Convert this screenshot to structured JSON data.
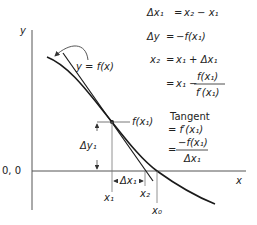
{
  "diagram": {
    "type": "newton-raphson-tangent-method",
    "axes": {
      "y_label": "y",
      "x_label": "x",
      "origin_label": "0, 0"
    },
    "curve_label": "y = f(x)",
    "point_label": "f(x₁)",
    "delta_y_label": "Δy₁",
    "delta_x_label": "Δx₁",
    "x_ticks": {
      "x1": "x₁",
      "x2": "x₂",
      "x0": "x₀"
    },
    "equations": [
      {
        "lhs": "Δx₁",
        "rhs": "x₂ − x₁"
      },
      {
        "lhs": "Δy",
        "rhs": "−f(x₁)"
      },
      {
        "lhs": "x₂",
        "rhs": "x₁ + Δx₁"
      },
      {
        "lhs": "",
        "rhs_prefix": "x₁ −",
        "frac_num": "f(x₁)",
        "frac_den": "f′(x₁)"
      }
    ],
    "tangent_block": {
      "title": "Tangent",
      "line1": "= f′(x₁)",
      "frac_prefix": "=",
      "frac_num": "−f(x₁)",
      "frac_den": "Δx₁"
    },
    "colors": {
      "curve": "#1a1a1a",
      "axis": "#555555",
      "text": "#222222"
    }
  }
}
